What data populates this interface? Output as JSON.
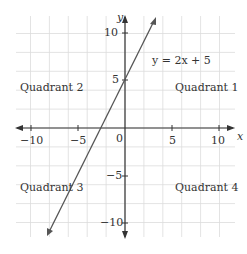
{
  "chart_data": {
    "type": "line",
    "title": "",
    "xlabel": "x",
    "ylabel": "y",
    "xlim": [
      -11.5,
      11.5
    ],
    "ylim": [
      -11.5,
      11.5
    ],
    "grid": true,
    "x_ticks": [
      -10,
      -5,
      0,
      5,
      10
    ],
    "y_ticks": [
      10,
      5,
      -5,
      -10
    ],
    "series": [
      {
        "name": "y = 2x + 5",
        "equation": "y = 2x + 5",
        "slope": 2,
        "intercept": 5,
        "x": [
          -8,
          3.1
        ],
        "y": [
          -11,
          11.2
        ]
      }
    ],
    "annotations": [
      {
        "text": "y = 2x + 5",
        "x": 3.5,
        "y": 7.5
      },
      {
        "text": "Quadrant 1",
        "x": 7,
        "y": 4
      },
      {
        "text": "Quadrant 2",
        "x": -7,
        "y": 4
      },
      {
        "text": "Quadrant 3",
        "x": -7,
        "y": -6
      },
      {
        "text": "Quadrant 4",
        "x": 7,
        "y": -6
      }
    ]
  },
  "labels": {
    "equation": "y = 2x + 5",
    "q1": "Quadrant 1",
    "q2": "Quadrant 2",
    "q3": "Quadrant 3",
    "q4": "Quadrant 4",
    "x_axis": "x",
    "y_axis": "y",
    "xt_m10": "−10",
    "xt_m5": "−5",
    "xt_0": "0",
    "xt_5": "5",
    "xt_10": "10",
    "yt_10": "10",
    "yt_5": "5",
    "yt_m5": "−5",
    "yt_m10": "−10"
  },
  "colors": {
    "grid": "#dcdcdc",
    "axis": "#333333",
    "line": "#555555"
  }
}
